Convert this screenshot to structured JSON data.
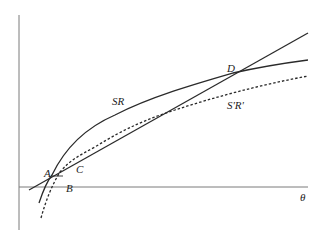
{
  "diagram": {
    "type": "economic-growth-diagram",
    "axes": {
      "horizontal_label": "θ",
      "vertical_label": ""
    },
    "curves": [
      {
        "id": "SR",
        "label": "SR",
        "style": "solid"
      },
      {
        "id": "SpRp",
        "label": "S'R'",
        "style": "dotted"
      },
      {
        "id": "ray",
        "label": "",
        "style": "solid"
      }
    ],
    "points": [
      {
        "id": "A",
        "label": "A"
      },
      {
        "id": "B",
        "label": "B"
      },
      {
        "id": "C",
        "label": "C"
      },
      {
        "id": "D",
        "label": "D"
      }
    ],
    "colors": {
      "line": "#2a2a2a",
      "axis": "#7a7a7a",
      "background": "#ffffff"
    }
  }
}
